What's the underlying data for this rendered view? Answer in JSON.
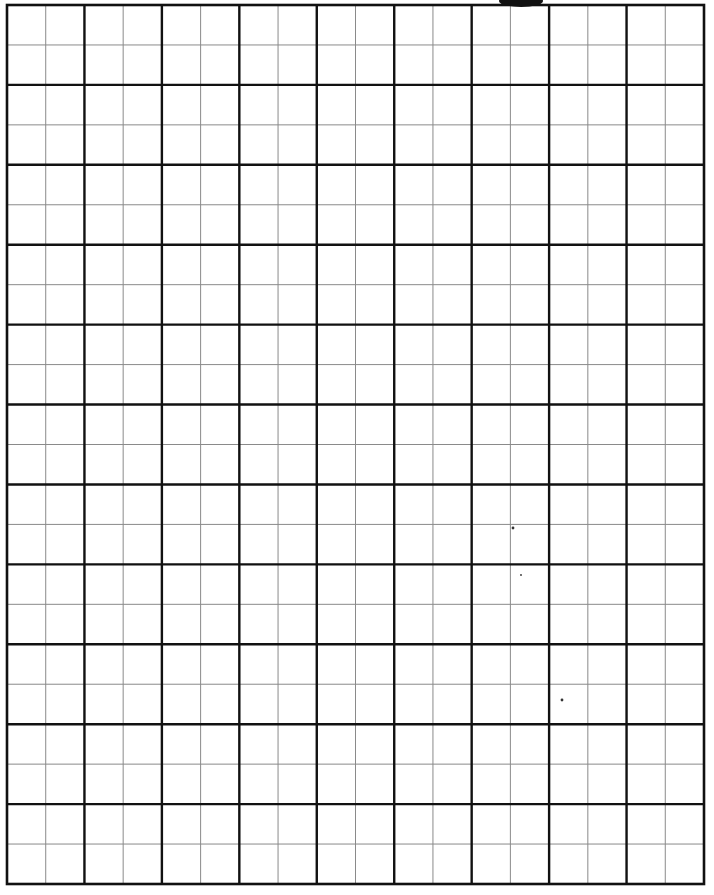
{
  "page": {
    "type": "graph-paper",
    "background_color": "#ffffff",
    "line_color": "#111111",
    "minor_line_color": "#8a8a8a"
  },
  "grid": {
    "major_columns": 9,
    "major_rows": 11,
    "subdivisions_per_major_cell": 2
  }
}
